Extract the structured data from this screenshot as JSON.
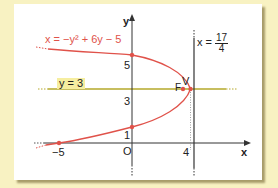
{
  "diagram": {
    "equation_label": "x = −y² + 6y − 5",
    "horizontal_line_label": "y = 3",
    "directrix_label_prefix": "x = ",
    "directrix_numerator": "17",
    "directrix_denominator": "4",
    "vertex_label": "V",
    "focus_label": "F",
    "x_axis_label": "x",
    "y_axis_label": "y",
    "origin_label": "O",
    "tick_labels": {
      "x_neg5": "−5",
      "x_4": "4",
      "y_1": "1",
      "y_3": "3",
      "y_5": "5"
    },
    "colors": {
      "curve": "#e0524a",
      "line_y3": "#b5a82a",
      "axes": "#333333",
      "background": "#f8f2c2",
      "card": "#ffffff"
    },
    "points": [
      {
        "name": "vertex",
        "x": 4,
        "y": 3
      },
      {
        "name": "focus",
        "x": 3.75,
        "y": 3
      },
      {
        "name": "y-intercept-top",
        "x": 0,
        "y": 5
      },
      {
        "name": "y-intercept-bottom",
        "x": 0,
        "y": 1
      },
      {
        "name": "x-intercept",
        "x": -5,
        "y": 0
      }
    ]
  }
}
